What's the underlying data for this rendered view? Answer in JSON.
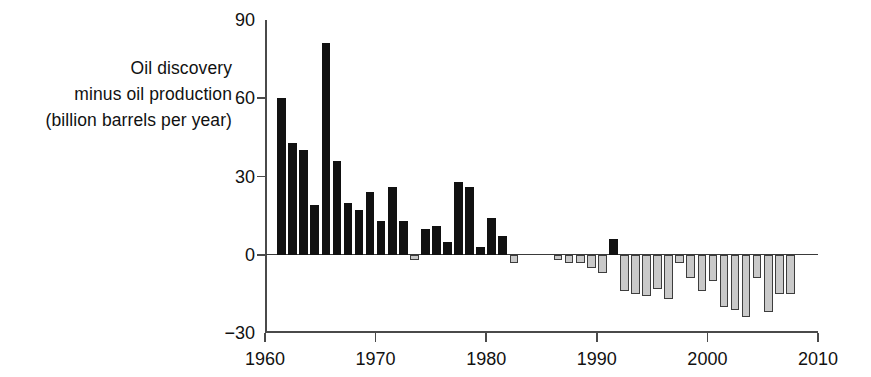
{
  "chart_data": {
    "type": "bar",
    "title": "",
    "subtitle": "",
    "ylabel_lines": [
      "Oil discovery",
      "minus oil production",
      "(billion barrels per year)"
    ],
    "ylabel": "Oil discovery minus oil production (billion barrels per year)",
    "xlabel": "",
    "ylim": [
      -30,
      90
    ],
    "xlim": [
      1960,
      2010
    ],
    "ytick_labels": [
      "90",
      "60",
      "30",
      "0",
      "−30"
    ],
    "yticks": [
      90,
      60,
      30,
      0,
      -30
    ],
    "xtick_labels": [
      "1960",
      "1970",
      "1980",
      "1990",
      "2000",
      "2010"
    ],
    "xticks": [
      1960,
      1970,
      1980,
      1990,
      2000,
      2010
    ],
    "grid": false,
    "legend": false,
    "colors": {
      "positive_bar": "#111111",
      "negative_bar_fill": "#c9c9c9",
      "negative_bar_edge": "#3d3d3d",
      "axis": "#4a4a4a",
      "text": "#111111",
      "background": "#ffffff"
    },
    "x": [
      1961,
      1962,
      1963,
      1964,
      1965,
      1966,
      1967,
      1968,
      1969,
      1970,
      1971,
      1972,
      1973,
      1974,
      1975,
      1976,
      1977,
      1978,
      1979,
      1980,
      1981,
      1982,
      1983,
      1984,
      1985,
      1986,
      1987,
      1988,
      1989,
      1990,
      1991,
      1992,
      1993,
      1994,
      1995,
      1996,
      1997,
      1998,
      1999,
      2000,
      2001,
      2002,
      2003,
      2004,
      2005,
      2006,
      2007
    ],
    "values": [
      60,
      43,
      40,
      19,
      81,
      36,
      20,
      17,
      24,
      13,
      26,
      13,
      -2,
      10,
      11,
      5,
      28,
      26,
      3,
      14,
      7,
      -3,
      0,
      0,
      0,
      -2,
      -3,
      -3,
      -5,
      -7,
      6,
      -14,
      -15,
      -16,
      -13,
      -17,
      -3,
      -9,
      -14,
      -10,
      -20,
      -21,
      -24,
      -9,
      -22,
      -15,
      -15
    ]
  }
}
